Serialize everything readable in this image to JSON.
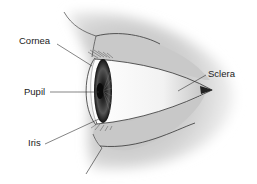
{
  "diagram": {
    "labels": [
      {
        "id": "cornea",
        "text": "Cornea"
      },
      {
        "id": "pupil",
        "text": "Pupil"
      },
      {
        "id": "iris",
        "text": "Iris"
      },
      {
        "id": "sclera",
        "text": "Sclera"
      }
    ]
  },
  "colors": {
    "skin_shade": "#c8c8c8",
    "pupil": "#111111",
    "label_text": "#222222",
    "leader_line": "#333333"
  }
}
